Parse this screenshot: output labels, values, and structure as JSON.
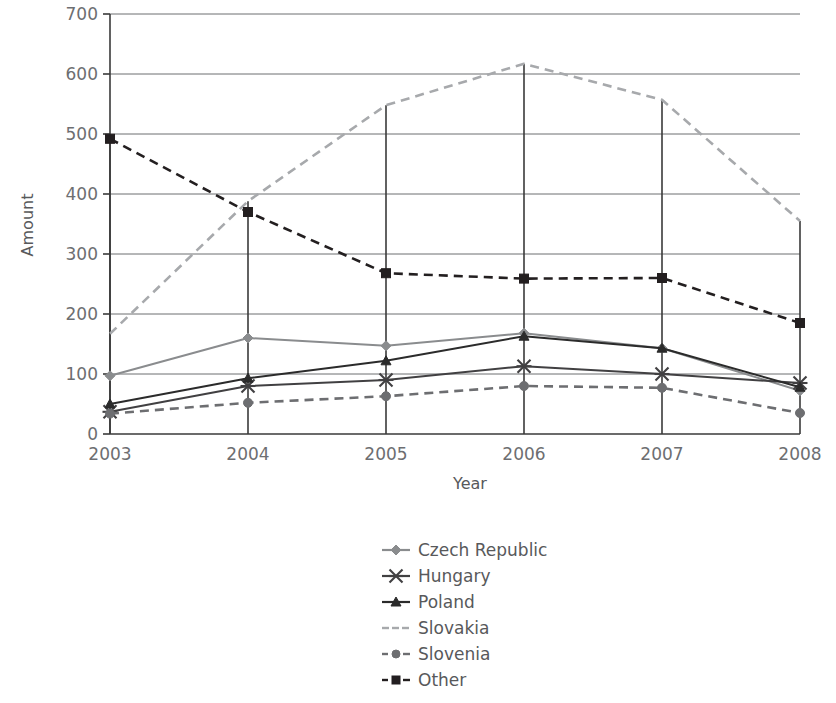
{
  "chart_data": {
    "type": "line",
    "title": "",
    "xlabel": "Year",
    "ylabel": "Amount",
    "categories": [
      "2003",
      "2004",
      "2005",
      "2006",
      "2007",
      "2008"
    ],
    "ylim": [
      0,
      700
    ],
    "yticks": [
      0,
      100,
      200,
      300,
      400,
      500,
      600,
      700
    ],
    "grid": true,
    "legend_position": "bottom-center",
    "series": [
      {
        "name": "Czech Republic",
        "values": [
          97,
          160,
          147,
          168,
          143,
          72
        ],
        "color": "#8a8c8e",
        "marker": "diamond",
        "dash": "solid"
      },
      {
        "name": "Hungary",
        "values": [
          37,
          80,
          90,
          113,
          100,
          85
        ],
        "color": "#414042",
        "marker": "star",
        "dash": "solid"
      },
      {
        "name": "Poland",
        "values": [
          50,
          93,
          122,
          163,
          143,
          78
        ],
        "color": "#2b2b2b",
        "marker": "triangle",
        "dash": "solid"
      },
      {
        "name": "Slovakia",
        "values": [
          167,
          388,
          548,
          617,
          557,
          355
        ],
        "color": "#a7a9ac",
        "marker": "none",
        "dash": "dashed"
      },
      {
        "name": "Slovenia",
        "values": [
          34,
          52,
          63,
          80,
          77,
          35
        ],
        "color": "#6d6e71",
        "marker": "circle",
        "dash": "dashed"
      },
      {
        "name": "Other",
        "values": [
          492,
          370,
          268,
          259,
          260,
          185
        ],
        "color": "#231f20",
        "marker": "square",
        "dash": "dashed"
      }
    ]
  },
  "axis": {
    "y_title": "Amount",
    "x_title": "Year",
    "y_tick_labels": [
      "0",
      "100",
      "200",
      "300",
      "400",
      "500",
      "600",
      "700"
    ],
    "x_tick_labels": [
      "2003",
      "2004",
      "2005",
      "2006",
      "2007",
      "2008"
    ]
  },
  "legend": {
    "items": [
      {
        "label": "Czech Republic"
      },
      {
        "label": "Hungary"
      },
      {
        "label": "Poland"
      },
      {
        "label": "Slovakia"
      },
      {
        "label": "Slovenia"
      },
      {
        "label": "Other"
      }
    ]
  }
}
